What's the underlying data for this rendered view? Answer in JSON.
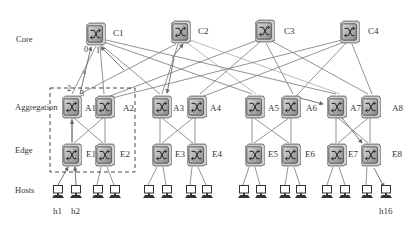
{
  "diagram": {
    "type": "fat-tree network topology",
    "tiers": {
      "core": "Core",
      "aggregation": "Aggregation",
      "edge": "Edge",
      "hosts": "Hosts"
    },
    "core_switches": [
      {
        "id": "C1",
        "label": "C1",
        "x": 96,
        "y": 34
      },
      {
        "id": "C2",
        "label": "C2",
        "x": 181,
        "y": 32
      },
      {
        "id": "C3",
        "label": "C3",
        "x": 265,
        "y": 31
      },
      {
        "id": "C4",
        "label": "C4",
        "x": 350,
        "y": 32
      }
    ],
    "aggregation_switches": [
      {
        "id": "A1",
        "label": "A1",
        "x": 72,
        "y": 106
      },
      {
        "id": "A2",
        "label": "A2",
        "x": 105,
        "y": 106
      },
      {
        "id": "A3",
        "label": "A3",
        "x": 160,
        "y": 106
      },
      {
        "id": "A4",
        "label": "A4",
        "x": 195,
        "y": 106
      },
      {
        "id": "A5",
        "label": "A5",
        "x": 252,
        "y": 106
      },
      {
        "id": "A6",
        "label": "A6",
        "x": 291,
        "y": 106
      },
      {
        "id": "A7",
        "label": "A7",
        "x": 336,
        "y": 106
      },
      {
        "id": "A8",
        "label": "A8",
        "x": 370,
        "y": 106
      }
    ],
    "edge_switches": [
      {
        "id": "E1",
        "label": "E1",
        "x": 72,
        "y": 155
      },
      {
        "id": "E2",
        "label": "E2",
        "x": 105,
        "y": 155
      },
      {
        "id": "E3",
        "label": "E3",
        "x": 160,
        "y": 155
      },
      {
        "id": "E4",
        "label": "E4",
        "x": 195,
        "y": 155
      },
      {
        "id": "E5",
        "label": "E5",
        "x": 252,
        "y": 155
      },
      {
        "id": "E6",
        "label": "E6",
        "x": 291,
        "y": 155
      },
      {
        "id": "E7",
        "label": "E7",
        "x": 336,
        "y": 155
      },
      {
        "id": "E8",
        "label": "E8",
        "x": 370,
        "y": 155
      }
    ],
    "hosts": {
      "labels": {
        "h1": "h1",
        "h2": "h2",
        "h16": "h16"
      },
      "count": 16
    },
    "port_labels": {
      "p0": "0",
      "p1": "1",
      "p2": "2",
      "p3": "3"
    },
    "failed_link_marker": "×",
    "pod_box": "Pod 1 (dashed box around A1, A2, E1, E2)"
  }
}
